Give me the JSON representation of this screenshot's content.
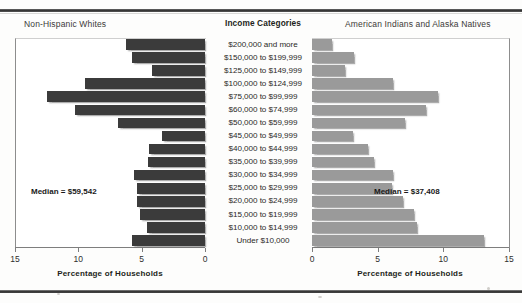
{
  "left_panel": {
    "title": "Non-Hispanic Whites",
    "axis_title": "Percentage of Households",
    "median_label": "Median = $59,542"
  },
  "right_panel": {
    "title": "American Indians and Alaska Natives",
    "axis_title": "Percentage of Households",
    "median_label": "Median = $37,408"
  },
  "center_header": "Income Categories",
  "chart_data": {
    "type": "bar",
    "subtype": "population-pyramid",
    "title": "Income Categories",
    "xlabel": "Percentage of Households",
    "ylabel": "",
    "grid": false,
    "legend": "none",
    "categories": [
      "$200,000 and more",
      "$150,000 to $199,999",
      "$125,000 to $149,999",
      "$100,000 to $124,999",
      "$75,000 to $99,999",
      "$60,000 to $74,999",
      "$50,000 to $59,999",
      "$45,000 to $49,999",
      "$40,000 to $44,999",
      "$35,000 to $39,999",
      "$30,000 to $34,999",
      "$25,000 to $29,999",
      "$20,000 to $24,999",
      "$15,000 to $19,999",
      "$10,000 to $14,999",
      "Under $10,000"
    ],
    "series": [
      {
        "name": "Non-Hispanic Whites",
        "side": "left",
        "color": "#3b3b3b",
        "axis_direction": "reversed",
        "xlim": [
          0,
          15
        ],
        "ticks": [
          15,
          10,
          5,
          0
        ],
        "median_income": "$59,542",
        "values": [
          6.2,
          5.8,
          4.2,
          9.5,
          12.5,
          10.3,
          6.9,
          3.4,
          4.4,
          4.5,
          5.6,
          5.4,
          5.4,
          5.1,
          4.6,
          5.8
        ]
      },
      {
        "name": "American Indians and Alaska Natives",
        "side": "right",
        "color": "#9a9a9a",
        "axis_direction": "normal",
        "xlim": [
          0,
          15
        ],
        "ticks": [
          0,
          5,
          10,
          15
        ],
        "median_income": "$37,408",
        "values": [
          1.5,
          3.2,
          2.5,
          6.2,
          9.6,
          8.7,
          7.1,
          3.1,
          4.3,
          4.7,
          6.2,
          6.1,
          6.9,
          7.8,
          8.0,
          13.1
        ]
      }
    ]
  }
}
